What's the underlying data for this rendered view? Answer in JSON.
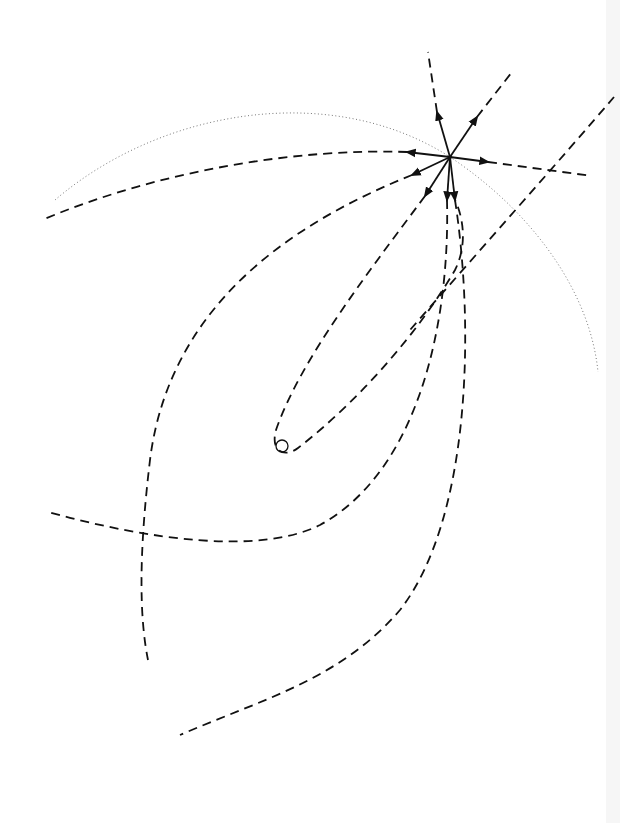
{
  "diagram": {
    "type": "trajectory-fan",
    "background": "#ffffff",
    "stroke_color": "#111111",
    "dotted_color": "#777777",
    "origin": {
      "x": 450,
      "y": 157
    },
    "target_circle": {
      "x": 282,
      "y": 446,
      "r": 6
    },
    "vectors": [
      {
        "name": "vector-up",
        "to": [
          437,
          112
        ]
      },
      {
        "name": "vector-up-right",
        "to": [
          477,
          117
        ]
      },
      {
        "name": "vector-right",
        "to": [
          488,
          162
        ]
      },
      {
        "name": "vector-left",
        "to": [
          407,
          152
        ]
      },
      {
        "name": "vector-down-left",
        "to": [
          412,
          175
        ]
      },
      {
        "name": "vector-lower-left",
        "to": [
          425,
          196
        ]
      },
      {
        "name": "vector-down-1",
        "to": [
          447,
          200
        ]
      },
      {
        "name": "vector-down-2",
        "to": [
          455,
          200
        ]
      }
    ],
    "trajectories": [
      {
        "name": "trajectory-upper-left",
        "d": "M407,152 C300,148 160,170 42,220"
      },
      {
        "name": "trajectory-left-loop",
        "d": "M412,175 C300,220 170,300 150,460 C138,560 140,620 148,660"
      },
      {
        "name": "trajectory-inner-loop",
        "d": "M425,196 C370,270 300,360 276,430 C270,452 285,458 298,448 C360,400 420,330 455,270 C470,240 460,210 455,200"
      },
      {
        "name": "trajectory-lower-loop",
        "d": "M447,200 C450,320 420,470 320,525 C260,555 150,540 48,512"
      },
      {
        "name": "trajectory-right-long",
        "d": "M455,200 C475,330 470,520 400,610 C340,680 260,700 180,735"
      },
      {
        "name": "trajectory-up",
        "d": "M437,112 L428,52"
      },
      {
        "name": "trajectory-up-right",
        "d": "M477,117 L512,72"
      },
      {
        "name": "trajectory-right",
        "d": "M488,162 L592,176"
      },
      {
        "name": "trajectory-diagonal",
        "d": "M614,97 C560,160 480,250 410,330"
      }
    ],
    "dotted_arc": {
      "name": "dotted-arc",
      "d": "M55,200 C160,110 330,80 450,157 C530,210 590,290 598,372"
    }
  }
}
